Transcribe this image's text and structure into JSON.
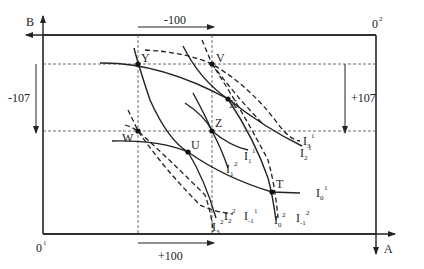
{
  "diagram": {
    "type": "edgeworth-box",
    "axes": {
      "origin_1": {
        "label": "0",
        "sup": "1"
      },
      "origin_2": {
        "label": "0",
        "sup": "2"
      },
      "axis_a": "A",
      "axis_b": "B"
    },
    "shifts": {
      "top": "-100",
      "bottom": "+100",
      "left": "-107",
      "right": "+107"
    },
    "points": {
      "Y": "Y",
      "V": "V",
      "X": "X",
      "Z": "Z",
      "W": "W",
      "U": "U",
      "T": "T"
    },
    "curve_labels": {
      "I3_1": {
        "base": "I",
        "sub": "3",
        "sup": "1"
      },
      "I2_1": {
        "base": "I",
        "sub": "2",
        "sup": "1"
      },
      "I1_1": {
        "base": "I",
        "sub": "1",
        "sup": "1"
      },
      "I1_2": {
        "base": "I",
        "sub": "1",
        "sup": "2"
      },
      "I0_1": {
        "base": "I",
        "sub": "0",
        "sup": "1"
      },
      "Im1_1": {
        "base": "I",
        "sub": "-1",
        "sup": "1"
      },
      "Im1_2": {
        "base": "I",
        "sub": "-1",
        "sup": "2"
      },
      "I0_2": {
        "base": "I",
        "sub": "0",
        "sup": "2"
      },
      "I2_2": {
        "base": "I",
        "sub": "2",
        "sup": "2"
      },
      "I3_2": {
        "base": "I",
        "sub": "3",
        "sup": "2"
      }
    },
    "colors": {
      "ink": "#222222",
      "background": "#ffffff"
    }
  }
}
